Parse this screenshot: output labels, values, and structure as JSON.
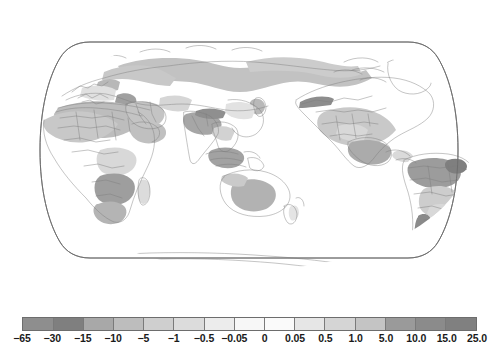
{
  "figure": {
    "type": "choropleth-world-map",
    "projection": "robinson",
    "background_color": "#ffffff",
    "outline_color": "#6b6b6b",
    "coastline_color": "#7d7d7d"
  },
  "chart_data": {
    "type": "heatmap",
    "title": "",
    "subtitle": "",
    "xlabel": "",
    "ylabel": "",
    "grid": false,
    "legend_position": "bottom",
    "colorbar": {
      "orientation": "horizontal",
      "tick_labels": [
        "-65",
        "-30",
        "-15",
        "-10",
        "-5",
        "-1",
        "-0.5",
        "-0.05",
        "0",
        "0.05",
        "0.5",
        "1.0",
        "5.0",
        "10.0",
        "15.0",
        "25.0"
      ],
      "tick_values": [
        -65,
        -30,
        -15,
        -10,
        -5,
        -1,
        -0.5,
        -0.05,
        0,
        0.05,
        0.5,
        1,
        5,
        10,
        15,
        25
      ],
      "boundaries": [
        -65,
        -30,
        -15,
        -10,
        -5,
        -1,
        -0.5,
        -0.05,
        0,
        0.05,
        0.5,
        1,
        5,
        10,
        15,
        25
      ],
      "segment_colors": [
        "#8e8e8e",
        "#7f7f7f",
        "#a8a8a8",
        "#bdbdbd",
        "#cfcfcf",
        "#dcdcdc",
        "#ececec",
        "#f7f7f7",
        "#fafafa",
        "#e6e6e6",
        "#d5d5d5",
        "#c4c4c4",
        "#9a9a9a",
        "#8b8b8b",
        "#808080"
      ],
      "range_min": -65,
      "range_max": 25
    },
    "regions": [
      {
        "name": "northern-eurasia-siberia",
        "value": -22,
        "shade": "#c2c2c2"
      },
      {
        "name": "west-africa-sahel",
        "value": -18,
        "shade": "#c8c8c8"
      },
      {
        "name": "north-africa-sahara",
        "value": -12,
        "shade": "#bdbdbd"
      },
      {
        "name": "arabian-peninsula",
        "value": -11,
        "shade": "#c4c4c4"
      },
      {
        "name": "southern-africa-zambia",
        "value": -35,
        "shade": "#9e9e9e"
      },
      {
        "name": "india-bangladesh",
        "value": -28,
        "shade": "#a6a6a6"
      },
      {
        "name": "southeast-asia-islands",
        "value": -30,
        "shade": "#a2a2a2"
      },
      {
        "name": "australia-interior",
        "value": -24,
        "shade": "#b2b2b2"
      },
      {
        "name": "north-america-great-plains",
        "value": -16,
        "shade": "#c9c9c9"
      },
      {
        "name": "central-america-mexico",
        "value": -26,
        "shade": "#ababab"
      },
      {
        "name": "amazon-basin",
        "value": -34,
        "shade": "#9c9c9c"
      },
      {
        "name": "southern-south-america",
        "value": -14,
        "shade": "#cdcdcd"
      },
      {
        "name": "andes-patagonia",
        "value": -45,
        "shade": "#8a8a8a"
      },
      {
        "name": "caucasus-black-sea",
        "value": -31,
        "shade": "#a0a0a0"
      },
      {
        "name": "antarctica",
        "value": 0,
        "shade": "#ffffff"
      }
    ]
  }
}
